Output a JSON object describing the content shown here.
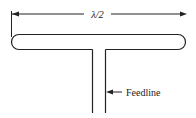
{
  "diagram": {
    "type": "folded-dipole antenna",
    "dimension_label": "λ/2",
    "feedline_label": "Feedline",
    "colors": {
      "line": "#222222",
      "background": "#ffffff"
    }
  }
}
